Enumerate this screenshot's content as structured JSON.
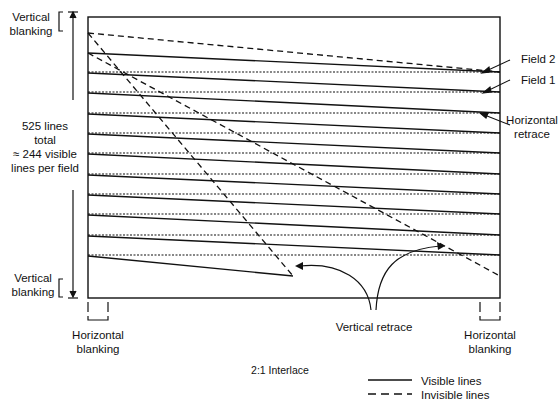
{
  "diagram": {
    "title": "2:1 Interlace",
    "labels": {
      "vertical_blanking_top": [
        "Vertical",
        "blanking"
      ],
      "vertical_blanking_bottom": [
        "Vertical",
        "blanking"
      ],
      "total_lines": [
        "525 lines",
        "total",
        "≈ 244 visible",
        "lines per field"
      ],
      "field_2": "Field 2",
      "field_1": "Field 1",
      "horizontal_retrace": [
        "Horizontal",
        "retrace"
      ],
      "vertical_retrace": "Vertical retrace",
      "horizontal_blanking_left": [
        "Horizontal",
        "blanking"
      ],
      "horizontal_blanking_right": [
        "Horizontal",
        "blanking"
      ]
    },
    "legend": [
      {
        "style": "solid",
        "label": "Visible lines"
      },
      {
        "style": "dashed",
        "label": "Invisible lines"
      }
    ],
    "colors": {
      "line": "#111111",
      "background": "#ffffff"
    }
  }
}
